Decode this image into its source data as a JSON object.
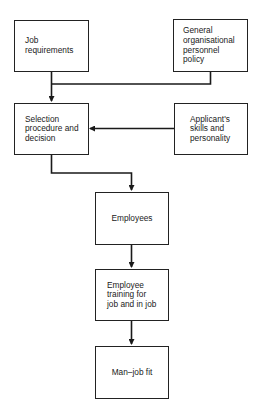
{
  "diagram": {
    "type": "flowchart",
    "nodes": {
      "job_requirements": {
        "label": "Job\nrequirements"
      },
      "general_policy": {
        "label": "General\norganisational\npersonnel\npolicy"
      },
      "selection": {
        "label": "Selection\nprocedure and\ndecision"
      },
      "applicant": {
        "label": "Applicant's\nskills and\npersonality"
      },
      "employees": {
        "label": "Employees"
      },
      "training": {
        "label": "Employee\ntraining for\njob and in job"
      },
      "man_job_fit": {
        "label": "Man–job fit"
      }
    },
    "edges": [
      {
        "from": "job_requirements",
        "to": "selection"
      },
      {
        "from": "general_policy",
        "to": "selection"
      },
      {
        "from": "applicant",
        "to": "selection"
      },
      {
        "from": "selection",
        "to": "employees"
      },
      {
        "from": "employees",
        "to": "training"
      },
      {
        "from": "training",
        "to": "man_job_fit"
      }
    ],
    "line_color": "#1a1a1a"
  }
}
